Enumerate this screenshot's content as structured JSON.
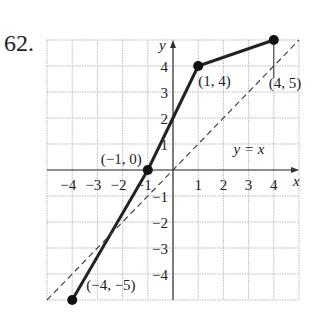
{
  "problem_number": "62.",
  "chart_data": {
    "type": "line",
    "title": "",
    "xlabel": "x",
    "ylabel": "y",
    "xlim": [
      -5,
      5
    ],
    "ylim": [
      -5,
      5
    ],
    "grid": true,
    "x_ticks": [
      -4,
      -3,
      -2,
      -1,
      1,
      2,
      3,
      4
    ],
    "y_ticks": [
      -4,
      -3,
      -2,
      -1,
      1,
      2,
      3,
      4
    ],
    "x_tick_labels": [
      "−4",
      "−3",
      "−2",
      "−1",
      "1",
      "2",
      "3",
      "4"
    ],
    "y_tick_labels": [
      "−4",
      "−3",
      "−2",
      "−1",
      "1",
      "2",
      "3",
      "4"
    ],
    "series": [
      {
        "name": "f(x)",
        "style": "solid",
        "x": [
          -4,
          -1,
          1,
          4
        ],
        "y": [
          -5,
          0,
          4,
          5
        ]
      },
      {
        "name": "y = x",
        "style": "dashed",
        "x": [
          -5,
          5
        ],
        "y": [
          -5,
          5
        ]
      }
    ],
    "annotations": [
      {
        "text": "(−4, −5)",
        "x": -4,
        "y": -5
      },
      {
        "text": "(−1, 0)",
        "x": -1,
        "y": 0
      },
      {
        "text": "(1, 4)",
        "x": 1,
        "y": 4
      },
      {
        "text": "(4, 5)",
        "x": 4,
        "y": 5
      },
      {
        "text": "y = x",
        "x": 3,
        "y": 2
      }
    ]
  }
}
